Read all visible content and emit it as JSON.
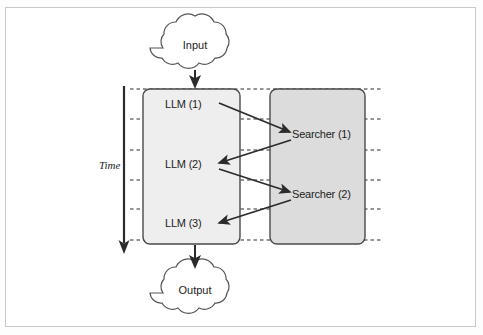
{
  "figure": {
    "background_color": "#ffffff",
    "frame_color": "#c9c9c9"
  },
  "axis": {
    "label": "Time",
    "direction": "downward",
    "color": "#2b2b2b"
  },
  "clouds": [
    {
      "id": "input",
      "label": "Input",
      "cx": 195,
      "cy": 45
    },
    {
      "id": "output",
      "label": "Output",
      "cx": 195,
      "cy": 290
    }
  ],
  "lanes": [
    {
      "id": "llm-lane",
      "name": "LLM lane",
      "fill": "#eeeeee",
      "stroke": "#4a4a4a",
      "x": 143,
      "y": 89,
      "width": 97,
      "height": 155
    },
    {
      "id": "searcher-lane",
      "name": "Searcher lane",
      "fill": "#dcdcdc",
      "stroke": "#4a4a4a",
      "x": 270,
      "y": 89,
      "width": 95,
      "height": 155
    }
  ],
  "nodes": [
    {
      "id": "llm-1",
      "label": "LLM (1)",
      "lane": "llm-lane",
      "x": 190,
      "y": 105
    },
    {
      "id": "searcher-1",
      "label": "Searcher (1)",
      "lane": "searcher-lane",
      "x": 294,
      "y": 135
    },
    {
      "id": "llm-2",
      "label": "LLM (2)",
      "lane": "llm-lane",
      "x": 190,
      "y": 165
    },
    {
      "id": "searcher-2",
      "label": "Searcher (2)",
      "lane": "searcher-lane",
      "x": 294,
      "y": 195
    },
    {
      "id": "llm-3",
      "label": "LLM (3)",
      "lane": "llm-lane",
      "x": 190,
      "y": 224
    }
  ],
  "timesteps": [
    89,
    119,
    150,
    180,
    209,
    240
  ],
  "connections": [
    {
      "id": "llm1-to-searcher1",
      "from": "llm-1",
      "to": "searcher-1"
    },
    {
      "id": "searcher1-to-llm2",
      "from": "searcher-1",
      "to": "llm-2"
    },
    {
      "id": "llm2-to-searcher2",
      "from": "llm-2",
      "to": "searcher-2"
    },
    {
      "id": "searcher2-to-llm3",
      "from": "searcher-2",
      "to": "llm-3"
    },
    {
      "id": "input-to-llm1",
      "from": "input",
      "to": "llm-1"
    },
    {
      "id": "llm3-to-output",
      "from": "llm-3",
      "to": "output"
    }
  ],
  "colors": {
    "llm_lane_fill": "#eeeeee",
    "searcher_lane_fill": "#dcdcdc",
    "lane_stroke": "#4a4a4a",
    "arrow": "#2b2b2b",
    "dotted_line": "#2b2b2b",
    "text": "#1d1d1d"
  }
}
